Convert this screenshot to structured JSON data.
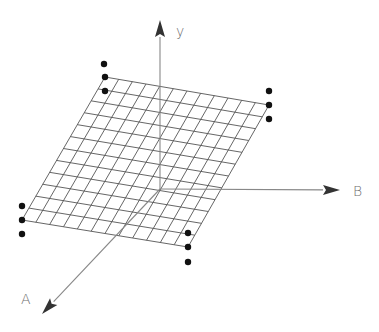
{
  "diagram": {
    "type": "3d-axes-with-plane-grid",
    "axes": [
      {
        "id": "y",
        "label": "y",
        "from": [
          160,
          189
        ],
        "to": [
          160,
          20
        ],
        "label_pos": [
          176,
          36
        ]
      },
      {
        "id": "B",
        "label": "B",
        "from": [
          160,
          189
        ],
        "to": [
          340,
          190
        ],
        "label_pos": [
          353,
          196
        ]
      },
      {
        "id": "A",
        "label": "A",
        "from": [
          160,
          189
        ],
        "to": [
          42,
          314
        ],
        "label_pos": [
          21,
          304
        ]
      }
    ],
    "plane": {
      "corners": {
        "top_left": [
          105,
          77
        ],
        "top_right": [
          269,
          105
        ],
        "bottom_right": [
          188,
          247
        ],
        "bottom_left": [
          22,
          220
        ]
      },
      "divisions_u": 12,
      "divisions_v": 12
    },
    "corner_dots": [
      {
        "corner": "top_left",
        "points": [
          [
            104,
            64
          ],
          [
            105,
            77
          ],
          [
            105,
            91
          ]
        ]
      },
      {
        "corner": "top_right",
        "points": [
          [
            269,
            91
          ],
          [
            269,
            105
          ],
          [
            269,
            119
          ]
        ]
      },
      {
        "corner": "bottom_left",
        "points": [
          [
            22,
            206
          ],
          [
            22,
            220
          ],
          [
            22,
            234
          ]
        ]
      },
      {
        "corner": "bottom_right",
        "points": [
          [
            188,
            233
          ],
          [
            188,
            247
          ],
          [
            188,
            262
          ]
        ]
      }
    ],
    "colors": {
      "grid": "#555555",
      "axis": "#888888",
      "arrowhead": "#333333",
      "dot": "#111111",
      "label": "#707070"
    }
  }
}
